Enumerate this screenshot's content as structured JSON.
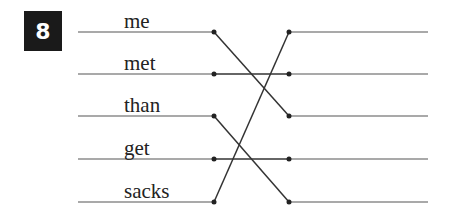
{
  "exercise": {
    "number": "8",
    "left_words": [
      "me",
      "met",
      "than",
      "get",
      "sacks"
    ],
    "right_blanks": [
      "",
      "",
      "",
      "",
      ""
    ],
    "connections": [
      {
        "from": 0,
        "to": 2
      },
      {
        "from": 1,
        "to": 1
      },
      {
        "from": 2,
        "to": 4
      },
      {
        "from": 3,
        "to": 3
      },
      {
        "from": 4,
        "to": 0
      }
    ],
    "line_color": "#444444",
    "badge_color": "#1a1a1a"
  }
}
